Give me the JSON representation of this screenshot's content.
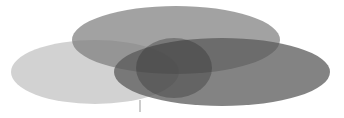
{
  "diagram": {
    "type": "venn",
    "sets": [
      {
        "id": "left",
        "cx": 95,
        "cy": 72,
        "rx": 84,
        "ry": 32,
        "fill": "#c8c8c8"
      },
      {
        "id": "top",
        "cx": 176,
        "cy": 40,
        "rx": 104,
        "ry": 34,
        "fill": "#8a8a8a"
      },
      {
        "id": "right",
        "cx": 222,
        "cy": 72,
        "rx": 108,
        "ry": 34,
        "fill": "#6e6e6e"
      }
    ],
    "marker": {
      "x": 140,
      "y": 108
    }
  }
}
